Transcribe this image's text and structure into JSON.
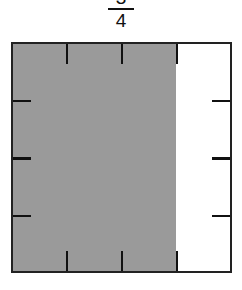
{
  "fraction": {
    "numerator": "3",
    "denominator": "4"
  },
  "diagram": {
    "shape": "square",
    "columns": 4,
    "rows": 4,
    "shaded_columns": 3,
    "colors": {
      "shade": "#9a9a9a",
      "border": "#222222",
      "background": "#ffffff"
    }
  }
}
